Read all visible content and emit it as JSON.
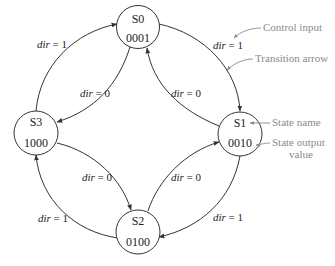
{
  "diagram": {
    "type": "state-machine",
    "title": "",
    "states": [
      {
        "id": "S0",
        "name": "S0",
        "output": "0001",
        "cx": 138,
        "cy": 27
      },
      {
        "id": "S1",
        "name": "S1",
        "output": "0010",
        "cx": 240,
        "cy": 134
      },
      {
        "id": "S2",
        "name": "S2",
        "output": "0100",
        "cx": 138,
        "cy": 232
      },
      {
        "id": "S3",
        "name": "S3",
        "output": "1000",
        "cx": 36,
        "cy": 133
      }
    ],
    "transitions": [
      {
        "from": "S0",
        "to": "S1",
        "label_var": "dir",
        "label_rest": " = 1"
      },
      {
        "from": "S1",
        "to": "S0",
        "label_var": "dir",
        "label_rest": " = 0"
      },
      {
        "from": "S0",
        "to": "S3",
        "label_var": "dir",
        "label_rest": " = 0"
      },
      {
        "from": "S3",
        "to": "S0",
        "label_var": "dir",
        "label_rest": " = 1"
      },
      {
        "from": "S3",
        "to": "S2",
        "label_var": "dir",
        "label_rest": " = 0"
      },
      {
        "from": "S2",
        "to": "S3",
        "label_var": "dir",
        "label_rest": " = 1"
      },
      {
        "from": "S2",
        "to": "S1",
        "label_var": "dir",
        "label_rest": " = 0"
      },
      {
        "from": "S1",
        "to": "S2",
        "label_var": "dir",
        "label_rest": " = 1"
      }
    ],
    "annotations": {
      "control_input": "Control input",
      "transition_arrow": "Transition arrow",
      "state_name": "State name",
      "state_output_line1": "State output",
      "state_output_line2": "value"
    },
    "colors": {
      "stroke": "#333333",
      "text": "#222222",
      "annotation": "#8a8a8a",
      "background": "#ffffff"
    }
  }
}
